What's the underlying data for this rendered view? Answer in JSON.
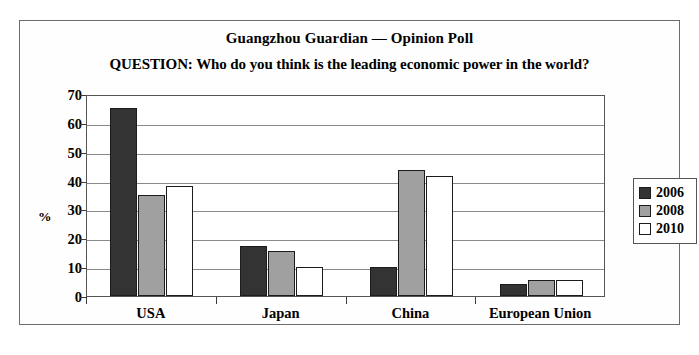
{
  "chart_data": {
    "type": "bar",
    "title": "Guangzhou Guardian — Opinion Poll",
    "subtitle": "QUESTION:  Who do you think is the leading economic power in the world?",
    "xlabel": "",
    "ylabel": "%",
    "ylim": [
      0,
      70
    ],
    "yticks": [
      0,
      10,
      20,
      30,
      40,
      50,
      60,
      70
    ],
    "grid": true,
    "legend_position": "right",
    "categories": [
      "USA",
      "Japan",
      "China",
      "European Union"
    ],
    "series": [
      {
        "name": "2006",
        "color": "#333333",
        "values": [
          65,
          17.5,
          10,
          4
        ]
      },
      {
        "name": "2008",
        "color": "#a0a0a0",
        "values": [
          35,
          15.5,
          43.5,
          5.5
        ]
      },
      {
        "name": "2010",
        "color": "#ffffff",
        "values": [
          38,
          10,
          41.5,
          5.5
        ]
      }
    ]
  },
  "legend": {
    "entries": [
      {
        "label": "2006"
      },
      {
        "label": "2008"
      },
      {
        "label": "2010"
      }
    ]
  },
  "colors": {
    "series_2006": "#333333",
    "series_2008": "#a0a0a0",
    "series_2010": "#ffffff",
    "border": "#6d6d6d",
    "gridline": "#8a8a8a",
    "text": "#000000"
  }
}
